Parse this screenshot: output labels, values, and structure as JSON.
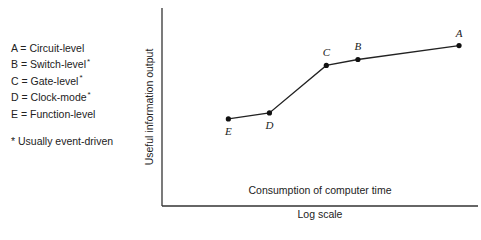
{
  "legend": {
    "items": [
      {
        "key": "A",
        "label": "A = Circuit-level",
        "starred": false
      },
      {
        "key": "B",
        "label": "B = Switch-level",
        "starred": true
      },
      {
        "key": "C",
        "label": "C = Gate-level",
        "starred": true
      },
      {
        "key": "D",
        "label": "D = Clock-mode",
        "starred": true
      },
      {
        "key": "E",
        "label": "E = Function-level",
        "starred": false
      }
    ],
    "star": "*",
    "note": "* Usually event-driven"
  },
  "axes": {
    "ylabel": "Useful information output",
    "xlabel_inner": "Consumption of computer time",
    "xlabel": "Log scale"
  },
  "chart_data": {
    "type": "line",
    "title": "",
    "xlabel": "Consumption of computer time (Log scale)",
    "ylabel": "Useful information output",
    "grid": false,
    "ticks": false,
    "legend_position": "left",
    "points": [
      {
        "label": "E",
        "name": "Function-level",
        "x": 0.21,
        "y": 0.44
      },
      {
        "label": "D",
        "name": "Clock-mode",
        "x": 0.34,
        "y": 0.47
      },
      {
        "label": "C",
        "name": "Gate-level",
        "x": 0.52,
        "y": 0.71
      },
      {
        "label": "B",
        "name": "Switch-level",
        "x": 0.62,
        "y": 0.74
      },
      {
        "label": "A",
        "name": "Circuit-level",
        "x": 0.94,
        "y": 0.81
      }
    ],
    "note": "x and y are relative positions (0-1) along unlabeled axes; no numeric ticks shown"
  }
}
